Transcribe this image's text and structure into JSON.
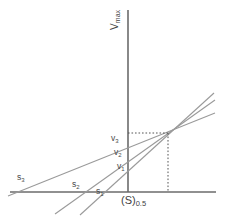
{
  "figure": {
    "name": "direct-linear-plot",
    "background_color": "#ffffff",
    "axis_color": "#6b6b6b",
    "line_color": "#9a9a9a",
    "guide_color": "#555555",
    "text_color": "#3a3a3a"
  },
  "axes": {
    "y_axis_label": "V",
    "y_axis_label_sub": "max",
    "x_axis_label": "(S)",
    "x_axis_label_sub": "0.5"
  },
  "labels": {
    "s1": "s",
    "s1_sub": "1",
    "s2": "s",
    "s2_sub": "2",
    "s3": "s",
    "s3_sub": "3",
    "v1": "v",
    "v1_sub": "1",
    "v2": "v",
    "v2_sub": "2",
    "v3": "v",
    "v3_sub": "3"
  },
  "chart_data": {
    "type": "line",
    "title": "",
    "xlabel": "(S)0.5",
    "ylabel": "Vmax",
    "grid": false,
    "legend": "none",
    "axis_pixel_geometry": {
      "y_axis_x": 128,
      "y_axis_top": 10,
      "x_axis_y": 192,
      "x_axis_left": 10,
      "x_axis_right": 216
    },
    "intersection_point": {
      "x": 168,
      "y": 133
    },
    "series": [
      {
        "name": "line-1",
        "s_intercept_x": 103,
        "v_intercept_y": 166,
        "x_start": 80,
        "y_start": 215,
        "x_end": 214,
        "y_end": 93
      },
      {
        "name": "line-2",
        "s_intercept_x": 83,
        "v_intercept_y": 155,
        "x_start": 55,
        "y_start": 214,
        "x_end": 215,
        "y_end": 100
      },
      {
        "name": "line-3",
        "s_intercept_x": 28,
        "v_intercept_y": 141,
        "x_start": 8,
        "y_start": 196,
        "x_end": 215,
        "y_end": 113
      }
    ],
    "guides": [
      {
        "name": "horizontal-dotted",
        "from": {
          "x": 128,
          "y": 133
        },
        "to": {
          "x": 168,
          "y": 133
        }
      },
      {
        "name": "vertical-dotted",
        "from": {
          "x": 168,
          "y": 133
        },
        "to": {
          "x": 168,
          "y": 192
        }
      }
    ]
  }
}
